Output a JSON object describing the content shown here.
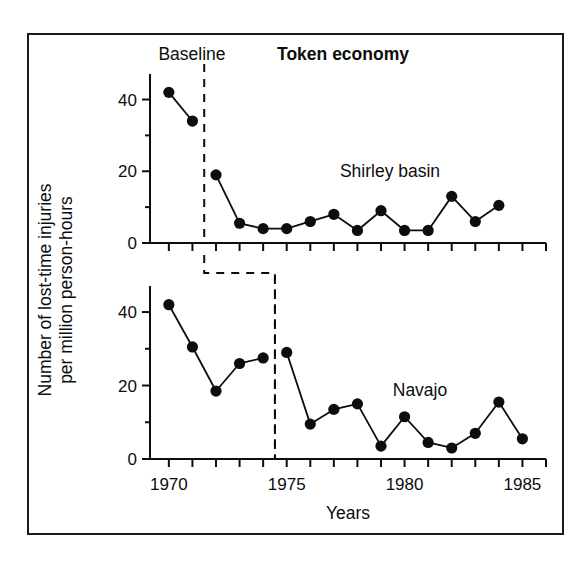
{
  "figure": {
    "frame_border_color": "#1a1a1a",
    "background": "#ffffff",
    "ink_color": "#0d0d0d"
  },
  "phase_labels": {
    "baseline": "Baseline",
    "treatment": "Token economy"
  },
  "axis": {
    "y_title_line1": "Number of lost-time injuries",
    "y_title_line2": "per million person-hours",
    "x_title": "Years",
    "y_major_ticks": [
      "0",
      "20",
      "40"
    ],
    "x_major_ticks": [
      "1970",
      "1975",
      "1980",
      "1985"
    ]
  },
  "chart_data": {
    "type": "line",
    "title": "Token economy",
    "subtitle": "Baseline",
    "xlabel": "Years",
    "ylabel": "Number of lost-time injuries per million person-hours",
    "xlim": [
      1969.2,
      1986.0
    ],
    "ylim": [
      0,
      46
    ],
    "grid": false,
    "legend": "none",
    "y_major_ticks": [
      0,
      20,
      40
    ],
    "y_minor_ticks": [
      10,
      30
    ],
    "x_major_ticks": [
      1970,
      1975,
      1980,
      1985
    ],
    "x_minor_ticks": [
      1971,
      1972,
      1973,
      1974,
      1976,
      1977,
      1978,
      1979,
      1981,
      1982,
      1983,
      1984,
      1986
    ],
    "panels": [
      {
        "name": "Shirley basin",
        "label": "Shirley basin",
        "intervention_year": 1971.5,
        "baseline_phase": "Baseline",
        "treatment_phase": "Token economy",
        "x": [
          1970,
          1971,
          1972,
          1973,
          1974,
          1975,
          1976,
          1977,
          1978,
          1979,
          1980,
          1981,
          1982,
          1983,
          1984
        ],
        "y": [
          42,
          34,
          19,
          5.5,
          4,
          4,
          6,
          8,
          3.5,
          9,
          3.5,
          3.5,
          13,
          6,
          10.5
        ],
        "baseline_points": [
          {
            "x": 1970,
            "y": 42
          },
          {
            "x": 1971,
            "y": 34
          }
        ],
        "treatment_points": [
          {
            "x": 1972,
            "y": 19
          },
          {
            "x": 1973,
            "y": 5.5
          },
          {
            "x": 1974,
            "y": 4
          },
          {
            "x": 1975,
            "y": 4
          },
          {
            "x": 1976,
            "y": 6
          },
          {
            "x": 1977,
            "y": 8
          },
          {
            "x": 1978,
            "y": 3.5
          },
          {
            "x": 1979,
            "y": 9
          },
          {
            "x": 1980,
            "y": 3.5
          },
          {
            "x": 1981,
            "y": 3.5
          },
          {
            "x": 1982,
            "y": 13
          },
          {
            "x": 1983,
            "y": 6
          },
          {
            "x": 1984,
            "y": 10.5
          }
        ]
      },
      {
        "name": "Navajo",
        "label": "Navajo",
        "intervention_year": 1974.5,
        "baseline_phase": "Baseline",
        "treatment_phase": "Token economy",
        "x": [
          1970,
          1971,
          1972,
          1973,
          1974,
          1975,
          1976,
          1977,
          1978,
          1979,
          1980,
          1981,
          1982,
          1983,
          1984,
          1985
        ],
        "y": [
          42,
          30.5,
          18.5,
          26,
          27.5,
          29,
          9.5,
          13.5,
          15,
          3.5,
          11.5,
          4.5,
          3,
          7,
          15.5,
          5.5
        ],
        "baseline_points": [
          {
            "x": 1970,
            "y": 42
          },
          {
            "x": 1971,
            "y": 30.5
          },
          {
            "x": 1972,
            "y": 18.5
          },
          {
            "x": 1973,
            "y": 26
          },
          {
            "x": 1974,
            "y": 27.5
          }
        ],
        "treatment_points": [
          {
            "x": 1975,
            "y": 29
          },
          {
            "x": 1976,
            "y": 9.5
          },
          {
            "x": 1977,
            "y": 13.5
          },
          {
            "x": 1978,
            "y": 15
          },
          {
            "x": 1979,
            "y": 3.5
          },
          {
            "x": 1980,
            "y": 11.5
          },
          {
            "x": 1981,
            "y": 4.5
          },
          {
            "x": 1982,
            "y": 3
          },
          {
            "x": 1983,
            "y": 7
          },
          {
            "x": 1984,
            "y": 15.5
          },
          {
            "x": 1985,
            "y": 5.5
          }
        ]
      }
    ]
  }
}
